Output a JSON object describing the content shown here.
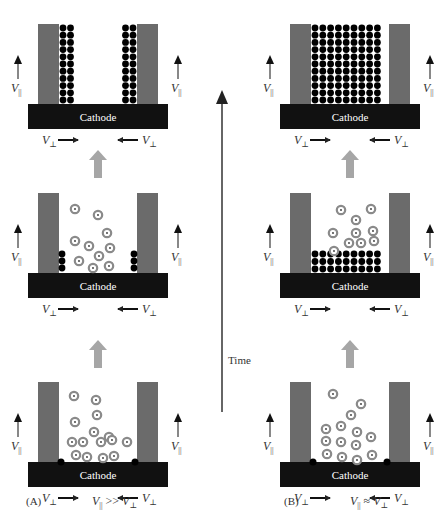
{
  "figure": {
    "time_axis_label": "Time",
    "cathode_label": "Cathode",
    "v_parallel": "V",
    "v_parallel_sub": "||",
    "v_perp": "V",
    "v_perp_sub": "⊥",
    "colors": {
      "cathode": "#111111",
      "wall": "#6b6b6b",
      "progress_arrow": "#a6a6a6",
      "ion_ring": "#8a8a8a",
      "deposit": "#000000"
    },
    "panels": [
      {
        "id": "A",
        "caption_letter": "(A)",
        "condition": "V|| >> V⊥",
        "condition_parts": [
          "V",
          "||",
          " >> ",
          "V",
          "⊥"
        ],
        "stages": [
          {
            "stage": "initial",
            "description": "ions in solution, small nuclei at base corners"
          },
          {
            "stage": "intermediate",
            "description": "growth along walls, ions in solution"
          },
          {
            "stage": "final",
            "description": "deposit grows up along side walls, center empty"
          }
        ]
      },
      {
        "id": "B",
        "caption_letter": "(B)",
        "condition": "V|| ≈ V⊥",
        "condition_parts": [
          "V",
          "||",
          " ≈ ",
          "V",
          "⊥"
        ],
        "stages": [
          {
            "stage": "initial",
            "description": "ions in solution, small nuclei at base corners"
          },
          {
            "stage": "intermediate",
            "description": "uniform bottom-up layer of deposit"
          },
          {
            "stage": "final",
            "description": "pore completely filled"
          }
        ]
      }
    ]
  }
}
